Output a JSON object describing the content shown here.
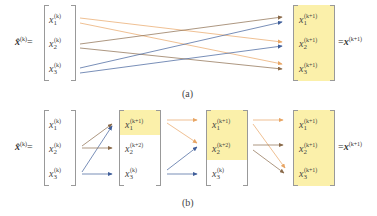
{
  "colors": {
    "orange": "#e8a564",
    "brown": "#8a6a4a",
    "blue": "#3f5e9a",
    "highlight": "#fbf0aa",
    "bracket": "#999999"
  },
  "panel_a": {
    "lhs_label": "x̂",
    "lhs_sup": "(k)",
    "lhs_eq": "=",
    "input_matrix": [
      {
        "var": "x",
        "sub": "1",
        "sup": "(k)"
      },
      {
        "var": "x",
        "sub": "2",
        "sup": "(k)"
      },
      {
        "var": "x",
        "sub": "3",
        "sup": "(k)"
      }
    ],
    "output_matrix": [
      {
        "var": "x",
        "sub": "1",
        "sup": "(k+1)"
      },
      {
        "var": "x",
        "sub": "2",
        "sup": "(k+1)"
      },
      {
        "var": "x",
        "sub": "3",
        "sup": "(k+1)"
      }
    ],
    "rhs_eq": "=",
    "rhs_label": "x",
    "rhs_sup": "(k+1)",
    "caption": "(a)",
    "arrows": [
      {
        "from": 1,
        "to": 2,
        "color": "orange"
      },
      {
        "from": 1,
        "to": 3,
        "color": "orange"
      },
      {
        "from": 2,
        "to": 1,
        "color": "brown"
      },
      {
        "from": 2,
        "to": 3,
        "color": "brown"
      },
      {
        "from": 3,
        "to": 1,
        "color": "blue"
      },
      {
        "from": 3,
        "to": 2,
        "color": "blue"
      }
    ]
  },
  "panel_b": {
    "lhs_label": "x̂",
    "lhs_sup": "(k)",
    "lhs_eq": "=",
    "matrix_1": [
      {
        "var": "x",
        "sub": "1",
        "sup": "(k)"
      },
      {
        "var": "x",
        "sub": "2",
        "sup": "(k)"
      },
      {
        "var": "x",
        "sub": "3",
        "sup": "(k)"
      }
    ],
    "matrix_2": [
      {
        "var": "x",
        "sub": "1",
        "sup": "(k+1)"
      },
      {
        "var": "x",
        "sub": "2",
        "sup": "(k+2)"
      },
      {
        "var": "x",
        "sub": "3",
        "sup": "(k)"
      }
    ],
    "matrix_3": [
      {
        "var": "x",
        "sub": "1",
        "sup": "(k+1)"
      },
      {
        "var": "x",
        "sub": "2",
        "sup": "(k+2)"
      },
      {
        "var": "x",
        "sub": "3",
        "sup": "(k)"
      }
    ],
    "matrix_4": [
      {
        "var": "x",
        "sub": "1",
        "sup": "(k+1)"
      },
      {
        "var": "x",
        "sub": "2",
        "sup": "(k+1)"
      },
      {
        "var": "x",
        "sub": "3",
        "sup": "(k+1)"
      }
    ],
    "rhs_eq": "=",
    "rhs_label": "x",
    "rhs_sup": "(k+1)",
    "caption": "(b)"
  }
}
